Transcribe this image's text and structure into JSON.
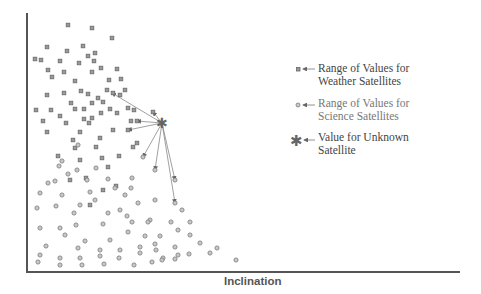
{
  "chart_data": {
    "type": "scatter",
    "title": "",
    "xlabel": "Inclination",
    "ylabel": "",
    "grid": false,
    "axes": {
      "x_ticks": [],
      "y_ticks": []
    },
    "legend_position": "right",
    "legend": [
      {
        "marker": "square",
        "label": "Range of Values for Weather Satellites"
      },
      {
        "marker": "circle",
        "label": "Range of Values for Science Satellites"
      },
      {
        "marker": "asterisk",
        "label": "Value for Unknown Satellite"
      }
    ],
    "plot_area_px": {
      "left": 27,
      "top": 13,
      "right": 460,
      "bottom": 272
    },
    "series": [
      {
        "name": "Weather Satellites",
        "marker": "square",
        "points_px": [
          [
            68,
            25
          ],
          [
            92,
            28
          ],
          [
            112,
            38
          ],
          [
            47,
            47
          ],
          [
            67,
            51
          ],
          [
            41,
            60
          ],
          [
            60,
            61
          ],
          [
            83,
            46
          ],
          [
            95,
            53
          ],
          [
            94,
            61
          ],
          [
            79,
            63
          ],
          [
            35,
            59
          ],
          [
            88,
            56
          ],
          [
            48,
            70
          ],
          [
            64,
            72
          ],
          [
            92,
            72
          ],
          [
            101,
            68
          ],
          [
            117,
            69
          ],
          [
            52,
            77
          ],
          [
            75,
            81
          ],
          [
            109,
            80
          ],
          [
            121,
            79
          ],
          [
            81,
            91
          ],
          [
            107,
            90
          ],
          [
            125,
            90
          ],
          [
            47,
            95
          ],
          [
            64,
            93
          ],
          [
            88,
            94
          ],
          [
            98,
            98
          ],
          [
            120,
            95
          ],
          [
            113,
            93
          ],
          [
            71,
            103
          ],
          [
            92,
            103
          ],
          [
            103,
            102
          ],
          [
            51,
            110
          ],
          [
            75,
            109
          ],
          [
            84,
            109
          ],
          [
            110,
            109
          ],
          [
            128,
            108
          ],
          [
            36,
            110
          ],
          [
            60,
            116
          ],
          [
            84,
            119
          ],
          [
            92,
            118
          ],
          [
            101,
            113
          ],
          [
            117,
            113
          ],
          [
            134,
            110
          ],
          [
            153,
            112
          ],
          [
            43,
            121
          ],
          [
            66,
            123
          ],
          [
            89,
            123
          ],
          [
            131,
            121
          ],
          [
            137,
            121
          ],
          [
            47,
            132
          ],
          [
            80,
            132
          ],
          [
            128,
            130
          ],
          [
            113,
            130
          ],
          [
            73,
            140
          ],
          [
            100,
            138
          ],
          [
            75,
            148
          ],
          [
            96,
            147
          ],
          [
            137,
            143
          ],
          [
            58,
            156
          ],
          [
            80,
            160
          ],
          [
            102,
            158
          ],
          [
            119,
            156
          ],
          [
            133,
            147
          ],
          [
            70,
            180
          ],
          [
            86,
            178
          ],
          [
            103,
            190
          ],
          [
            116,
            186
          ],
          [
            90,
            205
          ],
          [
            108,
            167
          ]
        ]
      },
      {
        "name": "Science Satellites",
        "marker": "circle",
        "points_px": [
          [
            78,
            145
          ],
          [
            62,
            161
          ],
          [
            59,
            166
          ],
          [
            96,
            168
          ],
          [
            77,
            170
          ],
          [
            48,
            183
          ],
          [
            55,
            181
          ],
          [
            68,
            174
          ],
          [
            87,
            180
          ],
          [
            108,
            179
          ],
          [
            115,
            188
          ],
          [
            132,
            178
          ],
          [
            143,
            157
          ],
          [
            40,
            193
          ],
          [
            62,
            195
          ],
          [
            90,
            192
          ],
          [
            125,
            195
          ],
          [
            131,
            188
          ],
          [
            155,
            170
          ],
          [
            175,
            180
          ],
          [
            95,
            200
          ],
          [
            120,
            210
          ],
          [
            138,
            203
          ],
          [
            155,
            200
          ],
          [
            175,
            203
          ],
          [
            182,
            210
          ],
          [
            37,
            208
          ],
          [
            56,
            206
          ],
          [
            74,
            213
          ],
          [
            80,
            205
          ],
          [
            108,
            213
          ],
          [
            127,
            216
          ],
          [
            150,
            220
          ],
          [
            60,
            228
          ],
          [
            76,
            225
          ],
          [
            103,
            224
          ],
          [
            132,
            222
          ],
          [
            148,
            222
          ],
          [
            171,
            222
          ],
          [
            190,
            222
          ],
          [
            40,
            228
          ],
          [
            65,
            235
          ],
          [
            85,
            241
          ],
          [
            110,
            240
          ],
          [
            128,
            232
          ],
          [
            145,
            236
          ],
          [
            160,
            236
          ],
          [
            178,
            230
          ],
          [
            190,
            235
          ],
          [
            200,
            243
          ],
          [
            210,
            253
          ],
          [
            155,
            244
          ],
          [
            46,
            246
          ],
          [
            78,
            248
          ],
          [
            100,
            250
          ],
          [
            120,
            250
          ],
          [
            140,
            247
          ],
          [
            156,
            250
          ],
          [
            175,
            247
          ],
          [
            40,
            255
          ],
          [
            60,
            258
          ],
          [
            80,
            258
          ],
          [
            100,
            256
          ],
          [
            119,
            258
          ],
          [
            140,
            253
          ],
          [
            163,
            258
          ],
          [
            178,
            255
          ],
          [
            189,
            254
          ],
          [
            217,
            248
          ],
          [
            38,
            262
          ],
          [
            60,
            265
          ],
          [
            82,
            265
          ],
          [
            104,
            264
          ],
          [
            134,
            265
          ],
          [
            152,
            262
          ],
          [
            162,
            260
          ],
          [
            175,
            259
          ],
          [
            236,
            260
          ]
        ]
      },
      {
        "name": "Unknown Satellite",
        "marker": "asterisk",
        "points_px": [
          [
            162,
            123
          ]
        ]
      }
    ],
    "annotations": {
      "arrows_from_unknown_to": [
        [
          112,
          93
        ],
        [
          153,
          112
        ],
        [
          137,
          121
        ],
        [
          128,
          130
        ],
        [
          143,
          157
        ],
        [
          155,
          170
        ],
        [
          175,
          180
        ],
        [
          175,
          203
        ]
      ]
    }
  },
  "legend": {
    "weather_line1": "Range of Values for",
    "weather_line2": "Weather Satellites",
    "science_line1": "Range of Values for",
    "science_line2": "Science Satellites",
    "unknown_line1": "Value for Unknown",
    "unknown_line2": "Satellite"
  },
  "axes": {
    "xlabel": "Inclination"
  }
}
